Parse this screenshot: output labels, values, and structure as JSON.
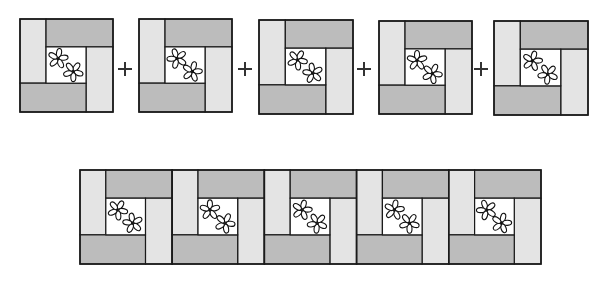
{
  "diagram": {
    "title": "Quilt block equation: five log-cabin flower blocks joined into a strip",
    "colors": {
      "background": "#ffffff",
      "light_strip": "#e4e4e4",
      "dark_strip": "#bcbcbc",
      "center": "#ffffff",
      "outline": "#1a1a1a",
      "flower_stroke": "#111111"
    },
    "top_row": {
      "operator": "+",
      "blocks": [
        {
          "x": 20,
          "y": 19,
          "size": 93
        },
        {
          "x": 139,
          "y": 19,
          "size": 93
        },
        {
          "x": 259,
          "y": 20,
          "size": 94
        },
        {
          "x": 379,
          "y": 21,
          "size": 93
        },
        {
          "x": 494,
          "y": 21,
          "size": 94
        }
      ],
      "plus_signs": [
        {
          "x": 118,
          "y": 62
        },
        {
          "x": 238,
          "y": 62
        },
        {
          "x": 357,
          "y": 62
        },
        {
          "x": 474,
          "y": 62
        }
      ]
    },
    "bottom_row": {
      "x": 80,
      "y": 170,
      "block_width": 92.2,
      "height": 94,
      "block_count": 5
    },
    "block_layout": {
      "left_strip_ratio": 0.28,
      "top_strip_ratio": 0.3,
      "right_strip_ratio": 0.29,
      "bottom_strip_ratio": 0.31,
      "description": "Light vertical strip on left, dark horizontal strip on top-right, light vertical strip on right, dark horizontal strip on bottom-left, white center square with two flowers"
    },
    "icons": {
      "flower": "flower-icon",
      "plus": "plus-icon"
    }
  }
}
